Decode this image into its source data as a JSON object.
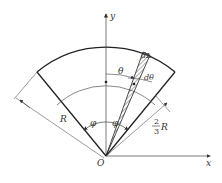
{
  "diagram": {
    "labels": {
      "y_axis": "y",
      "x_axis": "x",
      "origin": "O",
      "radius": "R",
      "half_angle_left": "φ",
      "half_angle_right": "φ",
      "theta": "θ",
      "d_theta": "dθ",
      "dL": "dL",
      "frac_num": "2",
      "frac_den": "3",
      "frac_var": "R"
    },
    "colors": {
      "stroke": "#333333",
      "thin": "#555555",
      "background": "#ffffff"
    }
  }
}
